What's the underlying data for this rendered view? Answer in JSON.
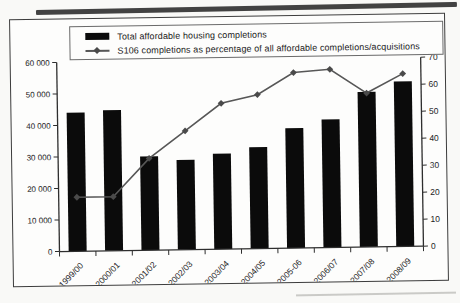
{
  "chart_data": {
    "type": "bar",
    "title": "",
    "categories": [
      "1999/00",
      "2000/01",
      "2001/02",
      "2002/03",
      "2003/04",
      "2004/05",
      "2005-06",
      "2006/07",
      "2007/08",
      "2008/09"
    ],
    "series": [
      {
        "name": "Total affordable housing completions",
        "type": "bar",
        "axis": "left",
        "values": [
          44000,
          44600,
          29800,
          28500,
          30300,
          32200,
          38100,
          40700,
          49200,
          52400
        ]
      },
      {
        "name": "S106 completions as percentage of all affordable completions/acquisitions",
        "type": "line",
        "axis": "right",
        "values": [
          20,
          20,
          34,
          44,
          54,
          57,
          65,
          66,
          57,
          64
        ]
      }
    ],
    "left_axis": {
      "min": 0,
      "max": 60000,
      "tick_step": 10000,
      "tick_labels": [
        "0",
        "10 000",
        "20 000",
        "30 000",
        "40 000",
        "50 000",
        "60 000"
      ]
    },
    "right_axis": {
      "min": 0,
      "max": 70,
      "tick_step": 10,
      "tick_labels": [
        "0",
        "10",
        "20",
        "30",
        "40",
        "50",
        "60",
        "70"
      ]
    },
    "legend_position": "top",
    "grid": false
  },
  "colors": {
    "bar": "#0b0b0b",
    "line": "#575757",
    "marker": "#4a4a4a",
    "axis": "#2e2e2e",
    "axis_text": "#1c1c1c",
    "frame": "#3c3c3c",
    "chart_bg": "#fdfdfc",
    "page_bg": "#f9f9f7",
    "scan_shadow": "#424242"
  }
}
